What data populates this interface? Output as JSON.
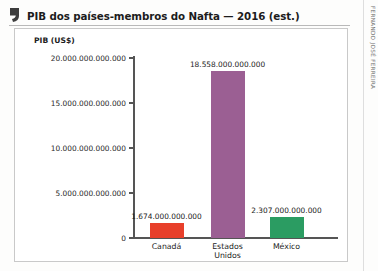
{
  "title": "PIB dos países-membros do Nafta — 2016 (est.)",
  "credit": "FERNANDO JOSÉ FERREIRA",
  "icon": {
    "quote": "quote-mark-icon"
  },
  "chart_data": {
    "type": "bar",
    "title": "PIB dos países-membros do Nafta — 2016 (est.)",
    "xlabel": "",
    "ylabel": "PIB (US$)",
    "categories": [
      "Canadá",
      "Estados\nUnidos",
      "México"
    ],
    "values": [
      1674000000000,
      18558000000000,
      2307000000000
    ],
    "value_labels": [
      "1.674.000.000.000",
      "18.558.000.000.000",
      "2.307.000.000.000"
    ],
    "colors": [
      "#e8402b",
      "#9b5f93",
      "#2b9c62"
    ],
    "ylim": [
      0,
      20000000000000
    ],
    "yticks": [
      0,
      5000000000000,
      10000000000000,
      15000000000000,
      20000000000000
    ],
    "ytick_labels": [
      "0",
      "5.000.000.000",
      "10.000.000.000.000",
      "15.000.000.000.000",
      "20.000.000.000.000"
    ],
    "grid": false,
    "legend": false
  },
  "ytick_display": [
    {
      "label": "20.000.000.000.000",
      "value": 20000000000000
    },
    {
      "label": "15.000.000.000.000",
      "value": 15000000000000
    },
    {
      "label": "10.000.000.000.000",
      "value": 10000000000000
    },
    {
      "label": "5.000.000.000.000",
      "value": 5000000000000
    },
    {
      "label": "0",
      "value": 0
    }
  ]
}
